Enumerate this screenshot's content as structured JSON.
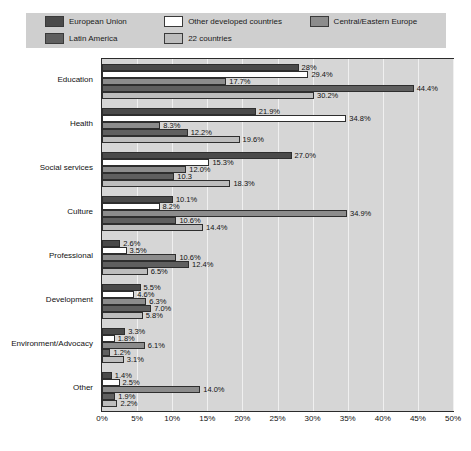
{
  "legend": {
    "items": [
      {
        "label": "European Union",
        "color": "#4a4a4a",
        "swatch_name": "legend-swatch-european-union"
      },
      {
        "label": "Other developed countries",
        "color": "#ffffff",
        "swatch_name": "legend-swatch-other-developed-countries"
      },
      {
        "label": "Central/Eastern Europe",
        "color": "#8c8c8c",
        "swatch_name": "legend-swatch-central-eastern-europe"
      },
      {
        "label": "Latin America",
        "color": "#5f5f5f",
        "swatch_name": "legend-swatch-latin-america"
      },
      {
        "label": "22 countries",
        "color": "#bdbdbd",
        "swatch_name": "legend-swatch-22-countries"
      }
    ]
  },
  "chart_data": {
    "type": "bar",
    "orientation": "horizontal",
    "title": "",
    "subtitle": "",
    "xlabel": "",
    "ylabel": "",
    "xlim": [
      0,
      50
    ],
    "xunit": "%",
    "grid": true,
    "legend_position": "top",
    "tick_labels": [
      "0%",
      "5%",
      "10%",
      "15%",
      "20%",
      "25%",
      "30%",
      "35%",
      "40%",
      "45%",
      "50%"
    ],
    "tick_values": [
      0,
      5,
      10,
      15,
      20,
      25,
      30,
      35,
      40,
      45,
      50
    ],
    "categories": [
      "Education",
      "Health",
      "Social services",
      "Culture",
      "Professional",
      "Development",
      "Environment/Advocacy",
      "Other"
    ],
    "series": [
      {
        "name": "European Union",
        "color": "#4a4a4a",
        "values": [
          28.0,
          21.9,
          27.0,
          10.1,
          2.6,
          5.5,
          3.3,
          1.4
        ],
        "labels": [
          "28%",
          "21.9%",
          "27.0%",
          "10.1%",
          "2.6%",
          "5.5%",
          "3.3%",
          "1.4%"
        ]
      },
      {
        "name": "Other developed countries",
        "color": "#ffffff",
        "values": [
          29.4,
          34.8,
          15.3,
          8.2,
          3.5,
          4.6,
          1.8,
          2.5
        ],
        "labels": [
          "29.4%",
          "34.8%",
          "15.3%",
          "8.2%",
          "3.5%",
          "4.6%",
          "1.8%",
          "2.5%"
        ]
      },
      {
        "name": "Central/Eastern Europe",
        "color": "#8c8c8c",
        "values": [
          17.7,
          8.3,
          12.0,
          34.9,
          10.6,
          6.3,
          6.1,
          14.0
        ],
        "labels": [
          "17.7%",
          "8.3%",
          "12.0%",
          "34.9%",
          "10.6%",
          "6.3%",
          "6.1%",
          "14.0%"
        ]
      },
      {
        "name": "Latin America",
        "color": "#5f5f5f",
        "values": [
          44.4,
          12.2,
          10.3,
          10.6,
          12.4,
          7.0,
          1.2,
          1.9
        ],
        "labels": [
          "44.4%",
          "12.2%",
          "10.3",
          "10.6%",
          "12.4%",
          "7.0%",
          "1.2%",
          "1.9%"
        ]
      },
      {
        "name": "22 countries",
        "color": "#bdbdbd",
        "values": [
          30.2,
          19.6,
          18.3,
          14.4,
          6.5,
          5.8,
          3.1,
          2.2
        ],
        "labels": [
          "30.2%",
          "19.6%",
          "18.3%",
          "14.4%",
          "6.5%",
          "5.8%",
          "3.1%",
          "2.2%"
        ]
      }
    ]
  }
}
